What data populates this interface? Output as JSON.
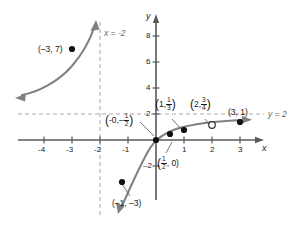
{
  "figure": {
    "type": "function-graph",
    "axes": {
      "x_label": "x",
      "y_label": "y",
      "x_ticks": [
        "-4",
        "-3",
        "-2",
        "-1",
        "1",
        "2",
        "3"
      ],
      "y_ticks": [
        "2",
        "4",
        "6",
        "8"
      ],
      "x_range": [
        -5.0,
        3.9
      ],
      "y_range": [
        -4.2,
        9.2
      ]
    },
    "asymptotes": [
      {
        "name": "vertical-asymptote",
        "label": "x = -2",
        "value": -2,
        "orientation": "vertical",
        "style": "dashed",
        "color": "#999999"
      },
      {
        "name": "horizontal-asymptote",
        "label": "y = 2",
        "value": 2,
        "orientation": "horizontal",
        "style": "dashed",
        "color": "#999999"
      }
    ],
    "curve": {
      "color": "#808080",
      "branches": [
        {
          "name": "left-branch",
          "description": "increasing from arrow at lower-left toward vertical asymptote x = -2"
        },
        {
          "name": "right-branch",
          "description": "increasing from arrow at lower-left below x = -2 toward horizontal asymptote y = 2"
        }
      ]
    },
    "points": [
      {
        "name": "point-neg3-7",
        "label": "(-3, 7)",
        "x": -3,
        "y": 7,
        "filled": true
      },
      {
        "name": "point-0-neg-half",
        "label": "(0, -1/2)",
        "x": 0,
        "y": -0.5,
        "filled": true,
        "label_num": "1",
        "label_den": "2",
        "sign": "-"
      },
      {
        "name": "point-half-0",
        "label": "(1/2, 0)",
        "x": 0.5,
        "y": 0,
        "filled": true,
        "label_num": "1",
        "label_den": "2"
      },
      {
        "name": "point-1-third",
        "label": "(1, 1/3)",
        "x": 1,
        "y": 0.333,
        "filled": true,
        "label_num": "1",
        "label_den": "3"
      },
      {
        "name": "point-2-three-quarters",
        "label": "(2, 3/4)",
        "x": 2,
        "y": 0.75,
        "filled": false,
        "label_num": "3",
        "label_den": "4"
      },
      {
        "name": "point-3-1",
        "label": "(3, 1)",
        "x": 3,
        "y": 1,
        "filled": true
      },
      {
        "name": "point-neg1-neg3",
        "label": "(-1, -3)",
        "x": -1,
        "y": -3,
        "filled": true
      }
    ],
    "labels": {
      "p_neg3_7": "(–3, 7)",
      "p_neg1_neg3": "(–1, –3)",
      "p_3_1": "(3, 1)",
      "asym_v": "x = –2",
      "asym_h": "y = 2",
      "open_text": "(2,",
      "close_text": ")",
      "one_text": "(1,",
      "zero_text": "(0,",
      "minus": "–",
      "comma_zero": ", 0)"
    },
    "colors": {
      "curve": "#808080",
      "asymptote": "#999999",
      "axis": "#555555",
      "point": "#111111",
      "text": "#1a1a1a"
    }
  }
}
